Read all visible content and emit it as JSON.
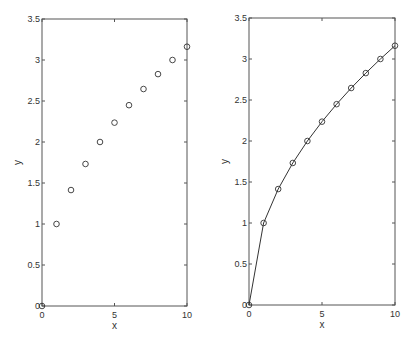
{
  "chart_data": [
    {
      "type": "scatter",
      "title": "",
      "xlabel": "x",
      "ylabel": "y",
      "xlim": [
        0,
        10
      ],
      "ylim": [
        0,
        3.5
      ],
      "xticks": [
        "0",
        "5",
        "10"
      ],
      "yticks": [
        "0",
        "0.5",
        "1",
        "1.5",
        "2",
        "2.5",
        "3",
        "3.5"
      ],
      "grid": false,
      "marker": "circle",
      "line": false,
      "x": [
        0,
        1,
        2,
        3,
        4,
        5,
        6,
        7,
        8,
        9,
        10
      ],
      "y": [
        0,
        1,
        1.414,
        1.732,
        2,
        2.236,
        2.449,
        2.646,
        2.828,
        3,
        3.162
      ]
    },
    {
      "type": "line",
      "title": "",
      "xlabel": "x",
      "ylabel": "y",
      "xlim": [
        0,
        10
      ],
      "ylim": [
        0,
        3.5
      ],
      "xticks": [
        "0",
        "5",
        "10"
      ],
      "yticks": [
        "0",
        "0.5",
        "1",
        "1.5",
        "2",
        "2.5",
        "3",
        "3.5"
      ],
      "grid": false,
      "marker": "circle",
      "line": true,
      "x": [
        0,
        1,
        2,
        3,
        4,
        5,
        6,
        7,
        8,
        9,
        10
      ],
      "y": [
        0,
        1,
        1.414,
        1.732,
        2,
        2.236,
        2.449,
        2.646,
        2.828,
        3,
        3.162
      ]
    }
  ],
  "plots": [
    {
      "box": {
        "x0": 42,
        "x1": 187,
        "y0": 19,
        "y1": 306
      }
    },
    {
      "box": {
        "x0": 249,
        "x1": 395,
        "y0": 18,
        "y1": 305
      }
    }
  ],
  "colors": {
    "axis": "#555555",
    "marker": "#333333",
    "line": "#333333"
  }
}
